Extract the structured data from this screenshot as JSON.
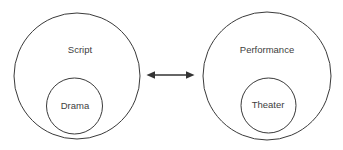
{
  "diagram": {
    "type": "venn-relationship-diagram",
    "background_color": "#ffffff",
    "stroke_color": "#3a3a3a",
    "text_color": "#404040",
    "groups": [
      {
        "id": "left-group",
        "outer": {
          "label": "Script",
          "cx": 77,
          "cy": 76,
          "r": 63,
          "label_x": 80,
          "label_y": 50
        },
        "inner": {
          "label": "Drama",
          "cx": 74.5,
          "cy": 106,
          "r": 28,
          "label_x": 75,
          "label_y": 106
        }
      },
      {
        "id": "right-group",
        "outer": {
          "label": "Performance",
          "cx": 267,
          "cy": 76,
          "r": 64,
          "label_x": 267,
          "label_y": 50
        },
        "inner": {
          "label": "Theater",
          "cx": 268.5,
          "cy": 105.5,
          "r": 27.5,
          "label_x": 268,
          "label_y": 105
        }
      }
    ],
    "connector": {
      "name": "bidirectional-arrow",
      "x1": 147,
      "x2": 194,
      "y": 75,
      "color": "#333333",
      "left_arrowhead": true,
      "right_arrowhead": true
    }
  }
}
